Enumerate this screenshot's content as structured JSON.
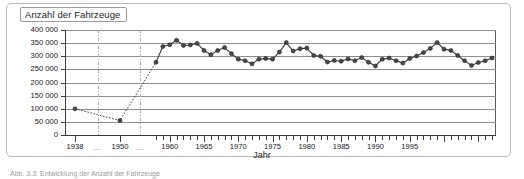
{
  "figure": {
    "title_box_label": "Anzahl der Fahrzeuge",
    "x_axis_title": "Jahr",
    "caption": "Abb. 3.3: Entwicklung der Anzahl der Fahrzeuge"
  },
  "colors": {
    "line": "#3a3a3a",
    "marker_fill": "#4a4a4a",
    "marker_edge": "#1a1a1a",
    "grid": "#8d8d8d",
    "axis": "#3b3b3b",
    "frame": "#b9b9b9",
    "background": "#ffffff"
  },
  "chart_data": {
    "type": "line",
    "title": "Anzahl der Fahrzeuge",
    "xlabel": "Jahr",
    "ylabel": "Anzahl der Fahrzeuge",
    "ylim": [
      0,
      400000
    ],
    "ytick_values": [
      0,
      50000,
      100000,
      150000,
      200000,
      250000,
      300000,
      350000,
      400000
    ],
    "ytick_labels": [
      "0",
      "50 000",
      "100 000",
      "150 000",
      "200 000",
      "250 000",
      "300 000",
      "350 000",
      "400 000"
    ],
    "xtick_labels": [
      "1938",
      "...",
      "1950",
      "...",
      "1960",
      "1965",
      "1970",
      "1975",
      "1980",
      "1985",
      "1990",
      "1995"
    ],
    "x_axis_broken": true,
    "x_break_notes": "Axis compressed between 1938-1950 and 1950-1958; dense yearly ticks begin at 1958",
    "grid": "horizontal",
    "legend": "none",
    "series": [
      {
        "name": "Anzahl der Fahrzeuge",
        "linestyle": "dotted-early-solid-late",
        "points": [
          {
            "x": 1938,
            "y": 100000
          },
          {
            "x": 1950,
            "y": 55000
          },
          {
            "x": 1958,
            "y": 277000
          },
          {
            "x": 1959,
            "y": 337000
          },
          {
            "x": 1960,
            "y": 344000
          },
          {
            "x": 1961,
            "y": 361000
          },
          {
            "x": 1962,
            "y": 341000
          },
          {
            "x": 1963,
            "y": 343000
          },
          {
            "x": 1964,
            "y": 349000
          },
          {
            "x": 1965,
            "y": 322000
          },
          {
            "x": 1966,
            "y": 306000
          },
          {
            "x": 1967,
            "y": 322000
          },
          {
            "x": 1968,
            "y": 333000
          },
          {
            "x": 1969,
            "y": 310000
          },
          {
            "x": 1970,
            "y": 289000
          },
          {
            "x": 1971,
            "y": 283000
          },
          {
            "x": 1972,
            "y": 271000
          },
          {
            "x": 1973,
            "y": 289000
          },
          {
            "x": 1974,
            "y": 291000
          },
          {
            "x": 1975,
            "y": 289000
          },
          {
            "x": 1976,
            "y": 316000
          },
          {
            "x": 1977,
            "y": 352000
          },
          {
            "x": 1978,
            "y": 320000
          },
          {
            "x": 1979,
            "y": 329000
          },
          {
            "x": 1980,
            "y": 331000
          },
          {
            "x": 1981,
            "y": 303000
          },
          {
            "x": 1982,
            "y": 300000
          },
          {
            "x": 1983,
            "y": 278000
          },
          {
            "x": 1984,
            "y": 284000
          },
          {
            "x": 1985,
            "y": 281000
          },
          {
            "x": 1986,
            "y": 290000
          },
          {
            "x": 1987,
            "y": 283000
          },
          {
            "x": 1988,
            "y": 295000
          },
          {
            "x": 1989,
            "y": 277000
          },
          {
            "x": 1990,
            "y": 263000
          },
          {
            "x": 1991,
            "y": 289000
          },
          {
            "x": 1992,
            "y": 293000
          },
          {
            "x": 1993,
            "y": 283000
          },
          {
            "x": 1994,
            "y": 274000
          },
          {
            "x": 1995,
            "y": 291000
          },
          {
            "x": 1996,
            "y": 301000
          },
          {
            "x": 1997,
            "y": 314000
          },
          {
            "x": 1998,
            "y": 330000
          },
          {
            "x": 1999,
            "y": 352000
          },
          {
            "x": 2000,
            "y": 327000
          },
          {
            "x": 2001,
            "y": 322000
          },
          {
            "x": 2002,
            "y": 303000
          },
          {
            "x": 2003,
            "y": 283000
          },
          {
            "x": 2004,
            "y": 265000
          },
          {
            "x": 2005,
            "y": 276000
          },
          {
            "x": 2006,
            "y": 283000
          },
          {
            "x": 2007,
            "y": 293000
          }
        ]
      }
    ]
  }
}
